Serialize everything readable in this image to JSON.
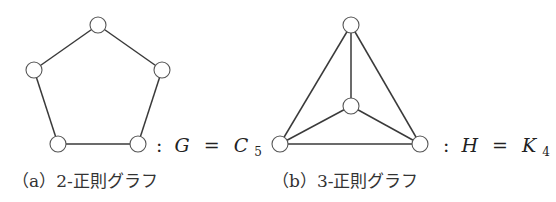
{
  "figures": [
    {
      "id": "a",
      "graph_name": "C5",
      "label": {
        "colon": ":",
        "lhs": "G",
        "eq": "=",
        "rhs_base": "C",
        "rhs_sub": "5"
      },
      "caption": "（a）2-正則グラフ",
      "nodes": [
        {
          "x": 98,
          "y": 25
        },
        {
          "x": 162,
          "y": 70
        },
        {
          "x": 138,
          "y": 144
        },
        {
          "x": 58,
          "y": 144
        },
        {
          "x": 34,
          "y": 70
        }
      ],
      "edges": [
        [
          0,
          1
        ],
        [
          1,
          2
        ],
        [
          2,
          3
        ],
        [
          3,
          4
        ],
        [
          4,
          0
        ]
      ]
    },
    {
      "id": "b",
      "graph_name": "K4",
      "label": {
        "colon": ":",
        "lhs": "H",
        "eq": "=",
        "rhs_base": "K",
        "rhs_sub": "4"
      },
      "caption": "（b）3-正則グラフ",
      "nodes": [
        {
          "x": 351,
          "y": 25
        },
        {
          "x": 351,
          "y": 106
        },
        {
          "x": 280,
          "y": 144
        },
        {
          "x": 420,
          "y": 144
        }
      ],
      "edges": [
        [
          0,
          1
        ],
        [
          0,
          2
        ],
        [
          0,
          3
        ],
        [
          1,
          2
        ],
        [
          1,
          3
        ],
        [
          2,
          3
        ]
      ]
    }
  ],
  "style": {
    "node_radius": 8,
    "edge_color": "#3a3a3a",
    "node_stroke": "#555555",
    "background": "#ffffff"
  }
}
